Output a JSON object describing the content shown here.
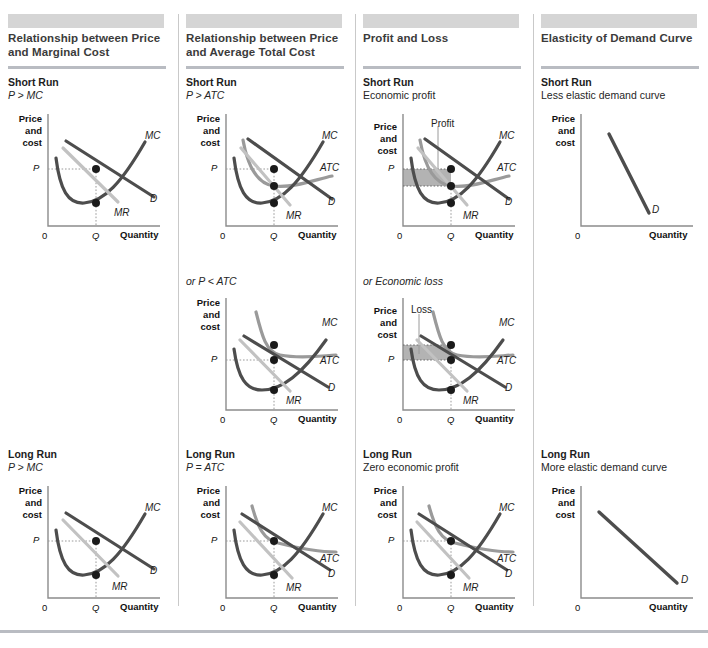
{
  "figure": {
    "bands": 4,
    "axis_labels": {
      "y_line1": "Price",
      "y_line2": "and",
      "y_line3": "cost",
      "x": "Quantity",
      "origin": "0"
    },
    "ticks": {
      "p": "P",
      "q": "Q"
    },
    "curves": {
      "mc": "MC",
      "mr": "MR",
      "d": "D",
      "atc": "ATC"
    },
    "colors": {
      "dark": "#4d4d4d",
      "mid": "#9a9a9a",
      "light": "#c2c2c2",
      "band": "#d5d5d5",
      "rule": "#b9bcc2",
      "shade": "#b3b3b3"
    }
  },
  "columns": [
    {
      "title": "Relationship between Price and Marginal Cost",
      "panels": [
        {
          "heading": "Short Run",
          "sub": "P > MC",
          "sub_italic": true,
          "graph": {
            "kind": "mc-only",
            "annotation": ""
          }
        },
        {
          "heading": "Long Run",
          "sub": "P > MC",
          "sub_italic": true,
          "graph": {
            "kind": "mc-only",
            "annotation": ""
          }
        }
      ]
    },
    {
      "title": "Relationship between Price and Average Total Cost",
      "panels": [
        {
          "heading": "Short Run",
          "sub": "P > ATC",
          "sub_italic": true,
          "graph": {
            "kind": "atc-above",
            "annotation": ""
          }
        },
        {
          "heading": "",
          "sub": "or P < ATC",
          "sub_italic": true,
          "graph": {
            "kind": "atc-below",
            "annotation": ""
          }
        },
        {
          "heading": "Long Run",
          "sub": "P = ATC",
          "sub_italic": true,
          "graph": {
            "kind": "atc-tangent",
            "annotation": ""
          }
        }
      ]
    },
    {
      "title": "Profit and Loss",
      "panels": [
        {
          "heading": "Short Run",
          "sub": "Economic profit",
          "sub_italic": false,
          "graph": {
            "kind": "profit",
            "annotation": "Profit"
          }
        },
        {
          "heading": "",
          "sub": "or Economic loss",
          "sub_italic": true,
          "graph": {
            "kind": "loss",
            "annotation": "Loss"
          }
        },
        {
          "heading": "Long Run",
          "sub": "Zero economic profit",
          "sub_italic": false,
          "graph": {
            "kind": "zero-profit",
            "annotation": ""
          }
        }
      ]
    },
    {
      "title": "Elasticity of Demand Curve",
      "panels": [
        {
          "heading": "Short Run",
          "sub": "Less elastic demand curve",
          "sub_italic": false,
          "graph": {
            "kind": "steep-d",
            "annotation": ""
          }
        },
        {
          "heading": "Long Run",
          "sub": "More elastic demand curve",
          "sub_italic": false,
          "graph": {
            "kind": "flat-d",
            "annotation": ""
          }
        }
      ]
    }
  ]
}
